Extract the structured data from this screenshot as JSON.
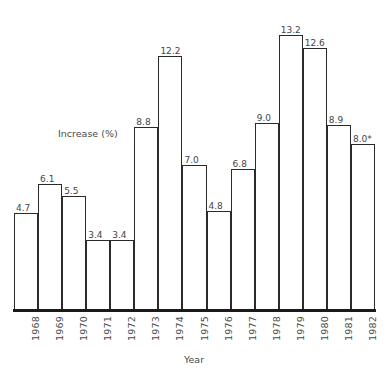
{
  "chart_data": {
    "type": "bar",
    "title": "INCREASE IN CONSUMER PRICE INDEX",
    "xlabel": "Year",
    "ylabel": "Increase (%)",
    "categories": [
      "1968",
      "1969",
      "1970",
      "1971",
      "1972",
      "1973",
      "1974",
      "1975",
      "1976",
      "1977",
      "1978",
      "1979",
      "1980",
      "1981",
      "1982"
    ],
    "values": [
      4.7,
      6.1,
      5.5,
      3.4,
      3.4,
      8.8,
      12.2,
      7.0,
      4.8,
      6.8,
      9.0,
      13.2,
      12.6,
      8.9,
      8.0
    ],
    "value_labels": [
      "4.7",
      "6.1",
      "5.5",
      "3.4",
      "3.4",
      "8.8",
      "12.2",
      "7.0",
      "4.8",
      "6.8",
      "9.0",
      "13.2",
      "12.6",
      "8.9",
      "8.0*"
    ],
    "ylim": [
      0,
      14.5
    ],
    "grid": false,
    "legend": null,
    "bar_fill_color": "#ffffff",
    "bar_outline_color": "#2b2b2b",
    "axis_color": "#1a1a1a",
    "text_color": "#4a4a4a"
  }
}
